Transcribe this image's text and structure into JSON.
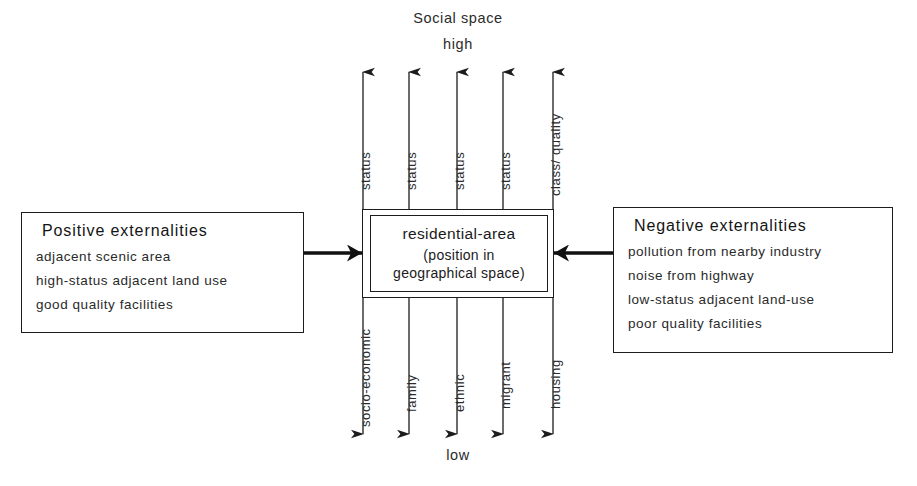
{
  "diagram": {
    "top_caption": "Social space",
    "top_pole": "high",
    "bottom_pole": "low",
    "center": {
      "title": "residential-area",
      "subtitle_line1": "(position in",
      "subtitle_line2": "geographical space)"
    },
    "axes": [
      {
        "x": 363,
        "double_headed": true,
        "top_label": "status",
        "bottom_label": "socio-economic"
      },
      {
        "x": 409,
        "double_headed": false,
        "top_label": "status",
        "bottom_label": "family"
      },
      {
        "x": 457,
        "double_headed": false,
        "top_label": "status",
        "bottom_label": "ethnic"
      },
      {
        "x": 503,
        "double_headed": false,
        "top_label": "status",
        "bottom_label": "migrant"
      },
      {
        "x": 553,
        "double_headed": true,
        "top_label": "class/ quality",
        "bottom_label": "housing"
      }
    ],
    "left_box": {
      "title": "Positive externalities",
      "items": [
        "adjacent scenic area",
        "high-status adjacent  land use",
        "good quality facilities"
      ]
    },
    "right_box": {
      "title": "Negative externalities",
      "items": [
        "pollution from nearby industry",
        "noise from highway",
        "low-status adjacent land-use",
        "poor quality facilities"
      ]
    },
    "connectors": [
      {
        "name": "positive-externalities-arrow",
        "direction": "right"
      },
      {
        "name": "negative-externalities-arrow",
        "direction": "left"
      }
    ],
    "colors": {
      "ink": "#1c1c1c",
      "text": "#2b2b2b",
      "background": "#ffffff"
    }
  }
}
